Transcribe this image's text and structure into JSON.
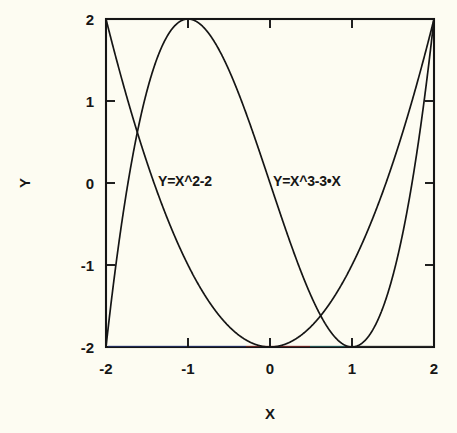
{
  "chart_data": {
    "type": "line",
    "title": "",
    "xlabel": "X",
    "ylabel": "Y",
    "xlim": [
      -2,
      2
    ],
    "ylim": [
      -2,
      2
    ],
    "xticks": [
      -2,
      -1,
      0,
      1,
      2
    ],
    "yticks": [
      -2,
      -1,
      0,
      1,
      2
    ],
    "xtick_labels": [
      "-2",
      "-1",
      "0",
      "1",
      "2"
    ],
    "ytick_labels": [
      "-2",
      "-1",
      "0",
      "1",
      "2"
    ],
    "grid": false,
    "legend_position": "inline-annotations",
    "series": [
      {
        "name": "Y=X^2-2",
        "expression": "x*x - 2",
        "color": "#151515",
        "label_x": 0.35,
        "label_y": 0.0,
        "x": [
          -2.0,
          -1.9,
          -1.8,
          -1.7,
          -1.6,
          -1.5,
          -1.4,
          -1.3,
          -1.2,
          -1.1,
          -1.0,
          -0.9,
          -0.8,
          -0.7,
          -0.6,
          -0.5,
          -0.4,
          -0.3,
          -0.2,
          -0.1,
          0.0,
          0.1,
          0.2,
          0.3,
          0.4,
          0.5,
          0.6,
          0.7,
          0.8,
          0.9,
          1.0,
          1.1,
          1.2,
          1.3,
          1.4,
          1.5,
          1.6,
          1.7,
          1.8,
          1.9,
          2.0
        ],
        "values": [
          2.0,
          1.61,
          1.24,
          0.89,
          0.56,
          0.25,
          -0.04,
          -0.31,
          -0.56,
          -0.79,
          -1.0,
          -1.19,
          -1.36,
          -1.51,
          -1.64,
          -1.75,
          -1.84,
          -1.91,
          -1.96,
          -1.99,
          -2.0,
          -1.99,
          -1.96,
          -1.91,
          -1.84,
          -1.75,
          -1.64,
          -1.51,
          -1.36,
          -1.19,
          -1.0,
          -0.79,
          -0.56,
          -0.31,
          -0.04,
          0.25,
          0.56,
          0.89,
          1.24,
          1.61,
          2.0
        ]
      },
      {
        "name": "Y=X^3-3•X",
        "expression": "x*x*x - 3*x",
        "color": "#151515",
        "label_x": 1.45,
        "label_y": 0.0,
        "x": [
          -2.0,
          -1.9,
          -1.8,
          -1.7,
          -1.6,
          -1.5,
          -1.4,
          -1.3,
          -1.2,
          -1.1,
          -1.0,
          -0.9,
          -0.8,
          -0.7,
          -0.6,
          -0.5,
          -0.4,
          -0.3,
          -0.2,
          -0.1,
          0.0,
          0.1,
          0.2,
          0.3,
          0.4,
          0.5,
          0.6,
          0.7,
          0.8,
          0.9,
          1.0,
          1.1,
          1.2,
          1.3,
          1.4,
          1.5,
          1.6,
          1.7,
          1.8,
          1.9,
          2.0
        ],
        "values": [
          -2.0,
          -1.0,
          -0.43,
          0.19,
          0.8,
          1.13,
          1.46,
          1.7,
          1.87,
          1.97,
          2.0,
          1.97,
          1.89,
          1.76,
          1.58,
          1.38,
          1.14,
          0.87,
          0.59,
          0.3,
          0.0,
          -0.3,
          -0.59,
          -0.87,
          -1.14,
          -1.38,
          -1.58,
          -1.76,
          -1.89,
          -1.97,
          -2.0,
          -1.97,
          -1.87,
          -1.7,
          -1.46,
          -1.13,
          -0.8,
          -0.19,
          0.43,
          1.0,
          2.0
        ]
      }
    ],
    "annotations": [
      {
        "text": "Y=X^2-2",
        "x": 0.35,
        "y": 0.0
      },
      {
        "text": "Y=X^3-3•X",
        "x": 1.45,
        "y": 0.0
      }
    ],
    "colors": {
      "background": "#fdfcf2",
      "frame": "#151515",
      "curve": "#151515",
      "text": "#161616"
    }
  }
}
